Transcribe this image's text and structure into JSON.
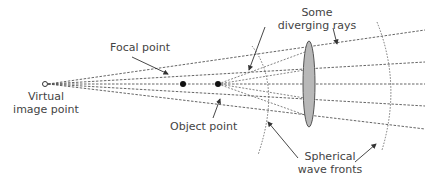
{
  "labels": {
    "focal_point": "Focal point",
    "diverging_rays_line1": "Some",
    "diverging_rays_line2": "diverging rays",
    "virtual_image_line1": "Virtual",
    "virtual_image_line2": "image point",
    "object_point": "Object point",
    "wave_fronts_line1": "Spherical",
    "wave_fronts_line2": "wave fronts"
  },
  "colors": {
    "ray": "#555555",
    "lens_fill": "#b8b8b8",
    "lens_stroke": "#555555",
    "point": "#111111",
    "text": "#444444"
  }
}
